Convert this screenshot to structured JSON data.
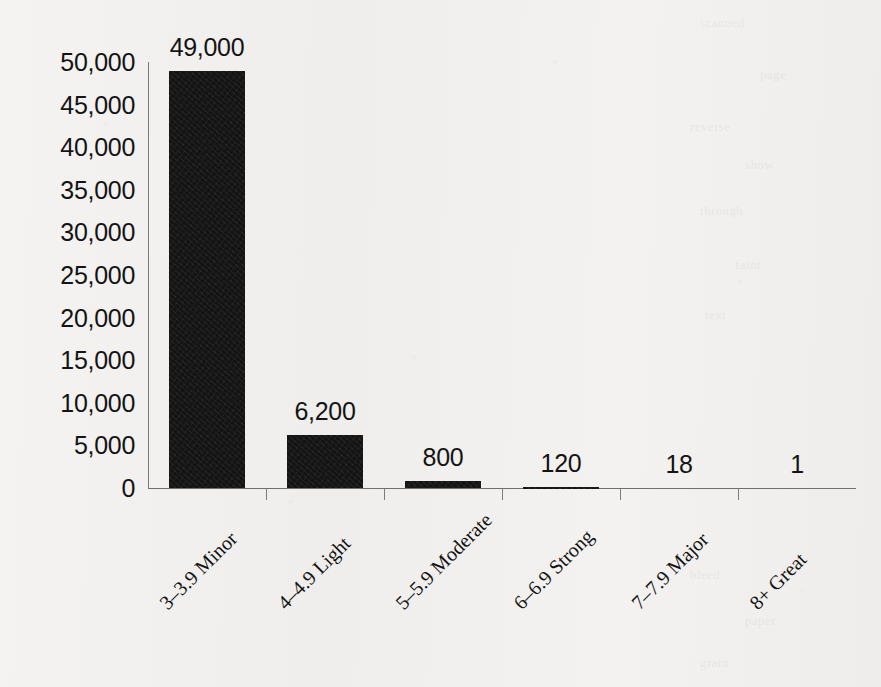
{
  "chart_data": {
    "type": "bar",
    "title": "",
    "subtitle": "",
    "xlabel": "",
    "ylabel": "",
    "categories": [
      "3–3.9 Minor",
      "4–4.9 Light",
      "5–5.9 Moderate",
      "6–6.9 Strong",
      "7–7.9 Major",
      "8+ Great"
    ],
    "values": [
      49000,
      6200,
      800,
      120,
      18,
      1
    ],
    "value_labels": [
      "49,000",
      "6,200",
      "800",
      "120",
      "18",
      "1"
    ],
    "ylim": [
      0,
      50000
    ],
    "ytick_values": [
      0,
      5000,
      10000,
      15000,
      20000,
      25000,
      30000,
      35000,
      40000,
      45000,
      50000
    ],
    "ytick_labels": [
      "0",
      "5,000",
      "10,000",
      "15,000",
      "20,000",
      "25,000",
      "30,000",
      "35,000",
      "40,000",
      "45,000",
      "50,000"
    ],
    "grid": false,
    "legend": false,
    "legend_position": "none",
    "bar_color": "#141414",
    "axis_color": "#6f6f6f",
    "background_color": "#f2f1ef",
    "text_color": "#141414"
  },
  "ghost_text": [
    "scanned",
    "page",
    "reverse",
    "show",
    "through",
    "faint",
    "text",
    "bleed",
    "paper",
    "grain"
  ]
}
